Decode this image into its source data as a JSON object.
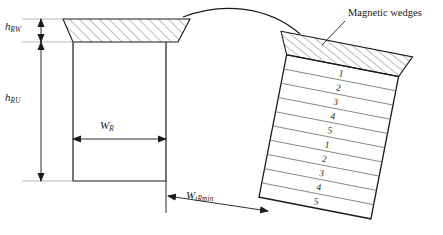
{
  "figure": {
    "background": "#ffffff",
    "line_color": "#1a1a1a",
    "hatch_color": "#555555",
    "width": 443,
    "height": 235
  },
  "dimensions": {
    "wedge_height": {
      "symbol": "h",
      "subscript": "RW",
      "orientation": "vertical"
    },
    "slot_height": {
      "symbol": "h",
      "subscript": "RU",
      "orientation": "vertical"
    },
    "slot_width": {
      "symbol": "W",
      "subscript": "R",
      "orientation": "horizontal"
    },
    "tooth_min_width": {
      "symbol": "W",
      "subscript": "tRmin",
      "orientation": "diagonal"
    }
  },
  "annotations": {
    "magnetic_wedges_label": "Magnetic wedges"
  },
  "detail_view": {
    "description": "Tilted slot detail with two groups of numbered conductor layers",
    "wedge_hatched": true,
    "layer_groups": [
      {
        "group": 1,
        "labels": [
          "1",
          "2",
          "3",
          "4",
          "5"
        ]
      },
      {
        "group": 2,
        "labels": [
          "1",
          "2",
          "3",
          "4",
          "5"
        ]
      }
    ]
  }
}
